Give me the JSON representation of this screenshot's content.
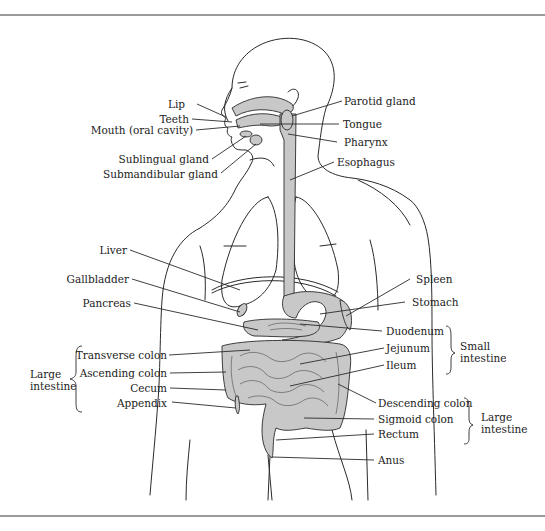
{
  "diagram": {
    "title_visible": false,
    "colors": {
      "organ_fill": "#c8c8c8",
      "line": "#2a2a2a",
      "rule": "#9a9a9a",
      "background": "#ffffff"
    },
    "labels_left": [
      {
        "id": "lip",
        "text": "Lip"
      },
      {
        "id": "teeth",
        "text": "Teeth"
      },
      {
        "id": "mouth",
        "text": "Mouth (oral cavity)"
      },
      {
        "id": "sublingual",
        "text": "Sublingual gland"
      },
      {
        "id": "submandibular",
        "text": "Submandibular gland"
      },
      {
        "id": "liver",
        "text": "Liver"
      },
      {
        "id": "gallbladder",
        "text": "Gallbladder"
      },
      {
        "id": "pancreas",
        "text": "Pancreas"
      },
      {
        "id": "transverse_colon",
        "text": "Transverse colon"
      },
      {
        "id": "ascending_colon",
        "text": "Ascending colon"
      },
      {
        "id": "cecum",
        "text": "Cecum"
      },
      {
        "id": "appendix",
        "text": "Appendix"
      }
    ],
    "labels_right": [
      {
        "id": "parotid",
        "text": "Parotid gland"
      },
      {
        "id": "tongue",
        "text": "Tongue"
      },
      {
        "id": "pharynx",
        "text": "Pharynx"
      },
      {
        "id": "esophagus",
        "text": "Esophagus"
      },
      {
        "id": "spleen",
        "text": "Spleen"
      },
      {
        "id": "stomach",
        "text": "Stomach"
      },
      {
        "id": "duodenum",
        "text": "Duodenum"
      },
      {
        "id": "jejunum",
        "text": "Jejunum"
      },
      {
        "id": "ileum",
        "text": "Ileum"
      },
      {
        "id": "descending_colon",
        "text": "Descending colon"
      },
      {
        "id": "sigmoid_colon",
        "text": "Sigmoid colon"
      },
      {
        "id": "rectum",
        "text": "Rectum"
      },
      {
        "id": "anus",
        "text": "Anus"
      }
    ],
    "groups": {
      "large_intestine_left": {
        "line1": "Large",
        "line2": "intestine"
      },
      "small_intestine": {
        "line1": "Small",
        "line2": "intestine"
      },
      "large_intestine_right": {
        "line1": "Large",
        "line2": "intestine"
      }
    }
  }
}
